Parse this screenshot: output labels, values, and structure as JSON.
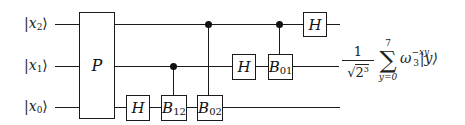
{
  "diagram": {
    "type": "quantum-circuit",
    "qubits": [
      {
        "id": "x2",
        "label_var": "x",
        "label_sub": "2",
        "y": 25
      },
      {
        "id": "x1",
        "label_var": "x",
        "label_sub": "1",
        "y": 67
      },
      {
        "id": "x0",
        "label_var": "x",
        "label_sub": "0",
        "y": 108
      }
    ],
    "ket_open": "|",
    "ket_close": "⟩",
    "gates": {
      "permutation": {
        "label": "P",
        "span": [
          "x2",
          "x1",
          "x0"
        ]
      },
      "h_x0": {
        "label": "H",
        "qubit": "x0"
      },
      "b12": {
        "label": "B",
        "sub": "12",
        "target": "x0",
        "control": "x1"
      },
      "b02": {
        "label": "B",
        "sub": "02",
        "target": "x0",
        "control": "x2"
      },
      "h_x1": {
        "label": "H",
        "qubit": "x1"
      },
      "b01": {
        "label": "B",
        "sub": "01",
        "target": "x1",
        "control": "x2"
      },
      "h_x2": {
        "label": "H",
        "qubit": "x2"
      }
    },
    "output": {
      "numerator": "1",
      "denominator_root": "√",
      "denominator_base": "2",
      "denominator_exp": "3",
      "sum_symbol": "∑",
      "sum_upper": "7",
      "sum_lower": "y=0",
      "omega": "ω",
      "omega_sub": "3",
      "omega_exp": "−xy",
      "ket": "|y⟩"
    },
    "colors": {
      "line": "#1a1a1a",
      "background": "#ffffff"
    }
  }
}
